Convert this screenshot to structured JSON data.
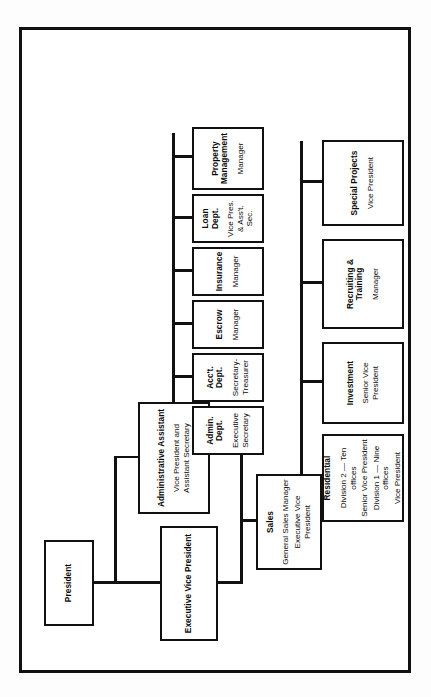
{
  "document": {
    "kind": "organization-chart",
    "orientation": "rotated-90-ccw"
  },
  "nodes": {
    "president": {
      "title": "President",
      "sub1": "",
      "sub2": "",
      "sub3": "",
      "sub4": ""
    },
    "admin_assistant": {
      "title": "Administrative Assistant",
      "sub1": "Vice President and\nAssistant Secretary"
    },
    "exec_vp": {
      "title": "Executive Vice President",
      "sub1": ""
    },
    "admin_dept": {
      "title": "Admin.\nDept.",
      "sub1": "Executive\nSecretary"
    },
    "acct_dept": {
      "title": "Acc't.\nDept.",
      "sub1": "Secretary-\nTreasurer"
    },
    "escrow": {
      "title": "Escrow",
      "sub1": "Manager"
    },
    "insurance": {
      "title": "Insurance",
      "sub1": "Manager"
    },
    "loan_dept": {
      "title": "Loan\nDept.",
      "sub1": "Vice Pres.\n& Ass't. Sec."
    },
    "property_mgmt": {
      "title": "Property\nManagement",
      "sub1": "Manager"
    },
    "sales": {
      "title": "Sales",
      "sub1": "General Sales Manager",
      "sub2": "Executive Vice President"
    },
    "residential": {
      "title": "Residential",
      "sub1": "Division 2 — Ten offices",
      "sub2": "Senior Vice President",
      "sub3": "Division 1 — Nine offices",
      "sub4": "Vice President"
    },
    "investment": {
      "title": "Investment",
      "sub1": "Senior Vice President"
    },
    "recruiting": {
      "title": "Recruiting & Training",
      "sub1": "Manager"
    },
    "special_projects": {
      "title": "Special Projects",
      "sub1": "Vice President"
    }
  },
  "colors": {
    "line": "#111111",
    "box_fill": "#ffffff",
    "page": "#ffffff",
    "text": "#0a0a0a"
  }
}
